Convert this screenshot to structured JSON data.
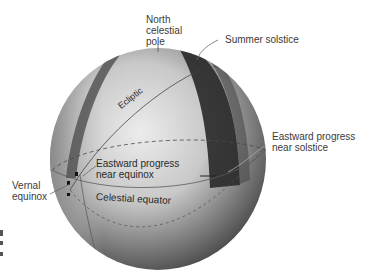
{
  "labels": {
    "north_pole": [
      "North",
      "celestial",
      "pole"
    ],
    "summer_solstice": "Summer solstice",
    "ecliptic": "Ecliptic",
    "eastward_solstice": [
      "Eastward progress",
      "near solstice"
    ],
    "eastward_equinox": [
      "Eastward progress",
      "near equinox"
    ],
    "vernal_equinox": [
      "Vernal",
      "equinox"
    ],
    "celestial_equator": "Celestial equator"
  },
  "colors": {
    "background": "#ffffff",
    "sphere_light": "#e6e6e6",
    "sphere_dark": "#3c3c3c",
    "band_dark": "#2a2a2a",
    "band_mid": "#5a5a5a",
    "text": "#3a3a3a"
  }
}
